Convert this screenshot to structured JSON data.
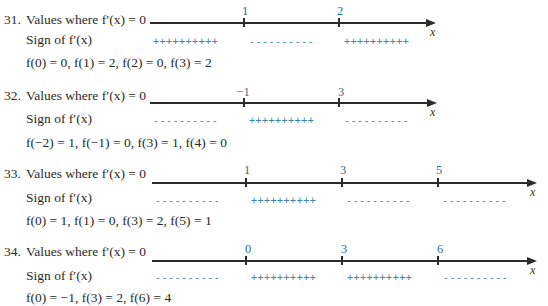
{
  "problems": [
    {
      "number": "31.",
      "values_label": "Values where f′(x) = 0",
      "sign_label": "Sign of f′(x)",
      "ticks": [
        "1",
        "2"
      ],
      "axis_var": "x",
      "signs": [
        "++++++++++",
        "----------",
        "++++++++++"
      ],
      "function_values": "f(0) = 0, f(1) = 2, f(2) = 0, f(3) = 2"
    },
    {
      "number": "32.",
      "values_label": "Values where f′(x) = 0",
      "sign_label": "Sign of f′(x)",
      "ticks": [
        "−1",
        "3"
      ],
      "axis_var": "x",
      "signs": [
        "----------",
        "++++++++++",
        "----------"
      ],
      "function_values": "f(−2) = 1, f(−1) = 0, f(3) = 1, f(4) = 0"
    },
    {
      "number": "33.",
      "values_label": "Values where f′(x) = 0",
      "sign_label": "Sign of f′(x)",
      "ticks": [
        "1",
        "3",
        "5"
      ],
      "axis_var": "x",
      "signs": [
        "----------",
        "++++++++++",
        "----------",
        "----------"
      ],
      "function_values": "f(0) = 1, f(1) = 0, f(3) = 2, f(5) = 1"
    },
    {
      "number": "34.",
      "values_label": "Values where f′(x) = 0",
      "sign_label": "Sign of f′(x)",
      "ticks": [
        "0",
        "3",
        "6"
      ],
      "axis_var": "x",
      "signs": [
        "----------",
        "++++++++++",
        "++++++++++",
        "----------"
      ],
      "function_values": "f(0) = −1, f(3) = 2, f(6) = 4"
    }
  ],
  "colors": {
    "text": "#2a2a2a",
    "tick_label": "#2e6f8a",
    "sign_chart": "#3d86a8",
    "axis": "#2b2b2b"
  }
}
